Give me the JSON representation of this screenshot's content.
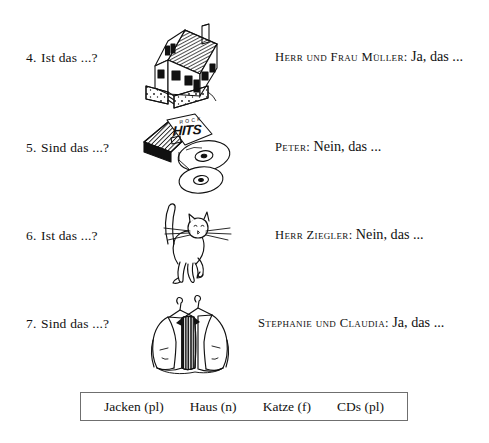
{
  "exercises": [
    {
      "number": "4.",
      "prompt": "Ist das ...?",
      "illustration": "house-illustration",
      "speaker": "Herr und Frau Müller:",
      "reply": "Ja, das ..."
    },
    {
      "number": "5.",
      "prompt": "Sind das ...?",
      "illustration": "cds-illustration",
      "speaker": "Peter:",
      "reply": "Nein, das ..."
    },
    {
      "number": "6.",
      "prompt": "Ist das ...?",
      "illustration": "cat-illustration",
      "speaker": "Herr Ziegler:",
      "reply": "Nein, das ..."
    },
    {
      "number": "7.",
      "prompt": "Sind das ...?",
      "illustration": "jackets-illustration",
      "speaker": "Stephanie und Claudia:",
      "reply": "Ja, das ..."
    }
  ],
  "illustration_labels": {
    "cd_case_line1": "ROCK",
    "cd_case_line2": "HITS"
  },
  "wordbank": {
    "words": [
      "Jacken (pl)",
      "Haus (n)",
      "Katze (f)",
      "CDs (pl)"
    ]
  },
  "colors": {
    "page_background": "#ffffff",
    "ink": "#111111",
    "wordbank_border": "#6f6f6f"
  }
}
